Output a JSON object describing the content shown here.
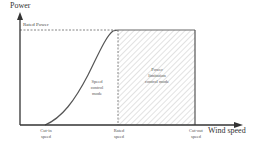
{
  "diagram": {
    "y_axis_label": "Power",
    "x_axis_label": "Wind speed",
    "rated_power_label": "Rated Power",
    "regions": [
      {
        "name": "speed-control",
        "lines": [
          "Speed",
          "control",
          "mode"
        ]
      },
      {
        "name": "power-limitation",
        "lines": [
          "Power",
          "limitation",
          "control mode"
        ]
      }
    ],
    "x_ticks": [
      {
        "lines": [
          "Cut-in",
          "speed"
        ]
      },
      {
        "lines": [
          "Rated",
          "speed"
        ]
      },
      {
        "lines": [
          "Cut-out",
          "speed"
        ]
      }
    ],
    "colors": {
      "axis": "#333333",
      "curve": "#555555",
      "dashed": "#666666",
      "hatch": "#cccccc"
    }
  }
}
